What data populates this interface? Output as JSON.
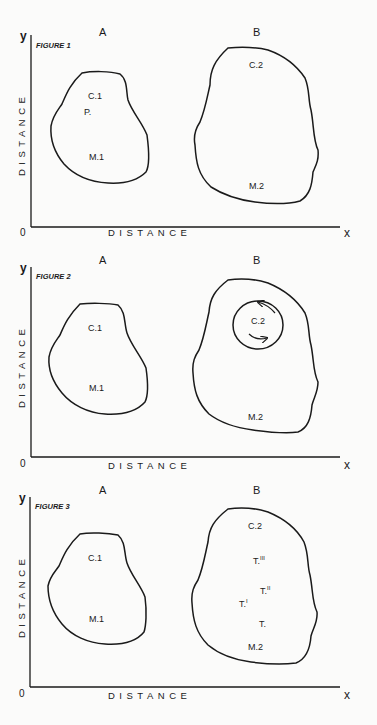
{
  "figures": [
    {
      "title": "FIGURE 1",
      "col_a": "A",
      "col_b": "B",
      "y_axis": "y",
      "x_axis": "x",
      "origin": "0",
      "y_label": "DISTANCE",
      "x_label": "DISTANCE",
      "labels_a": [
        "C.1",
        "P.",
        "M.1"
      ],
      "labels_b": [
        "C.2",
        "M.2"
      ]
    },
    {
      "title": "FIGURE 2",
      "col_a": "A",
      "col_b": "B",
      "y_axis": "y",
      "x_axis": "x",
      "origin": "0",
      "y_label": "DISTANCE",
      "x_label": "DISTANCE",
      "labels_a": [
        "C.1",
        "M.1"
      ],
      "labels_b": [
        "C.2",
        "M.2"
      ]
    },
    {
      "title": "FIGURE 3",
      "col_a": "A",
      "col_b": "B",
      "y_axis": "y",
      "x_axis": "x",
      "origin": "0",
      "y_label": "DISTANCE",
      "x_label": "DISTANCE",
      "labels_a": [
        "C.1",
        "M.1"
      ],
      "labels_b": [
        "C.2",
        "T.III",
        "T.II",
        "T.I",
        "T.",
        "M.2"
      ]
    }
  ]
}
